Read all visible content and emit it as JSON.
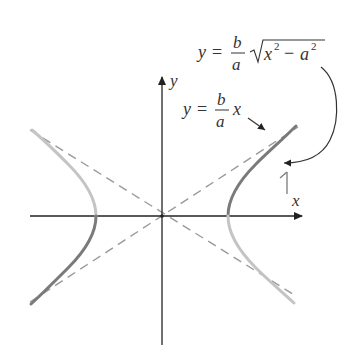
{
  "figure": {
    "type": "hyperbola-with-asymptotes",
    "colors": {
      "axis": "#222222",
      "asymptote": "#9a9a9a",
      "branch_dark": "#7a7a7a",
      "branch_light": "#c4c4c4",
      "annotation": "#333333"
    },
    "axes": {
      "x_label": "x",
      "y_label": "y"
    },
    "labels": {
      "hyperbola_eq": {
        "lhs": "y",
        "eq": "=",
        "num": "b",
        "den": "a",
        "radicand_x": "x",
        "exp1": "2",
        "minus": "−",
        "radicand_a": "a",
        "exp2": "2"
      },
      "asymptote_eq": {
        "lhs": "y",
        "eq": "=",
        "num": "b",
        "den": "a",
        "var": "x"
      }
    }
  }
}
